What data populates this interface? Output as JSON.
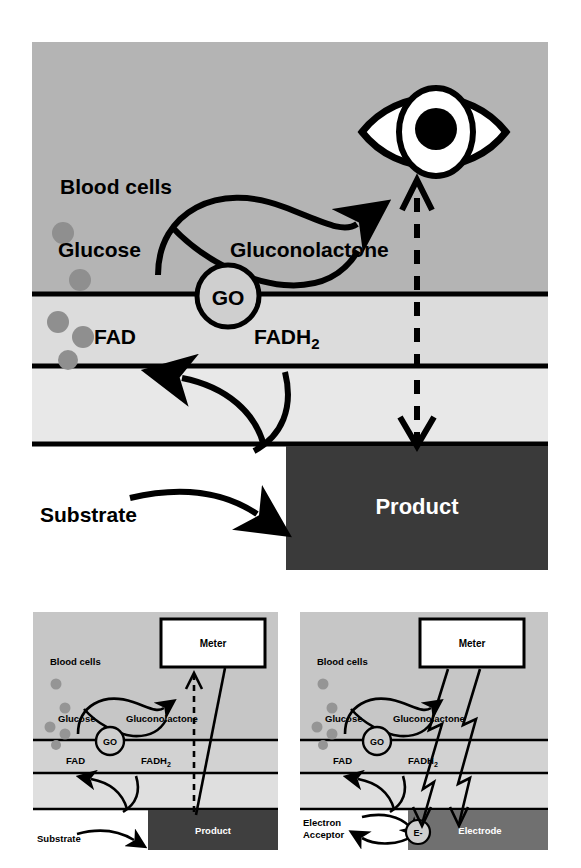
{
  "figure": {
    "panel_count": 3
  },
  "colors": {
    "page_background": "#ffffff",
    "sample_layer": "#b4b4b4",
    "enzyme_layer": "#dcdcdc",
    "mediator_layer": "#e6e6e6",
    "substrate_layer": "#ffffff",
    "product_bar": "#3a3a3a",
    "electrode_bar": "#6e6e6e",
    "blood_cell": "#8f8f8f",
    "line": "#000000",
    "meter_fill": "#ffffff",
    "product_text": "#ffffff"
  },
  "main_panel": {
    "name": "optical-biosensor-overview",
    "labels": {
      "blood_cells": "Blood cells",
      "glucose": "Glucose",
      "gluconolactone": "Gluconolactone",
      "enzyme": "GO",
      "fad": "FAD",
      "fadh2": "FADH",
      "fadh2_sub": "2",
      "substrate": "Substrate",
      "product": "Product"
    },
    "detector": "eye-icon",
    "signal_type": "optical (dashed arrow to eye)",
    "blood_cells": [
      {
        "cx": 63,
        "cy": 233,
        "r": 10
      },
      {
        "cx": 80,
        "cy": 280,
        "r": 10
      },
      {
        "cx": 58,
        "cy": 322,
        "r": 10
      },
      {
        "cx": 83,
        "cy": 337,
        "r": 10
      },
      {
        "cx": 68,
        "cy": 360,
        "r": 9
      }
    ]
  },
  "bottom_left_panel": {
    "name": "optical-meter-biosensor",
    "labels": {
      "blood_cells": "Blood cells",
      "glucose": "Glucose",
      "gluconolactone": "Gluconolactone",
      "enzyme": "GO",
      "fad": "FAD",
      "fadh2": "FADH",
      "fadh2_sub": "2",
      "substrate": "Substrate",
      "product": "Product",
      "meter": "Meter"
    },
    "signal_type": "optical (dashed arrow to meter)",
    "blood_cells": [
      {
        "cx": 56,
        "cy": 638,
        "r": 5
      },
      {
        "cx": 68,
        "cy": 663,
        "r": 5
      },
      {
        "cx": 50,
        "cy": 688,
        "r": 5
      },
      {
        "cx": 68,
        "cy": 696,
        "r": 5
      },
      {
        "cx": 58,
        "cy": 709,
        "r": 5
      }
    ]
  },
  "bottom_right_panel": {
    "name": "amperometric-biosensor",
    "labels": {
      "blood_cells": "Blood cells",
      "glucose": "Glucose",
      "gluconolactone": "Gluconolactone",
      "enzyme": "GO",
      "fad": "FAD",
      "fadh2": "FADH",
      "fadh2_sub": "2",
      "electron_acceptor_line1": "Electron",
      "electron_acceptor_line2": "Acceptor",
      "electron": "E-",
      "electrode": "Electrode",
      "meter": "Meter"
    },
    "signal_type": "electrical (lightning bolts to meter)",
    "blood_cells": [
      {
        "cx": 318,
        "cy": 638,
        "r": 5
      },
      {
        "cx": 330,
        "cy": 663,
        "r": 5
      },
      {
        "cx": 312,
        "cy": 688,
        "r": 5
      },
      {
        "cx": 330,
        "cy": 696,
        "r": 5
      },
      {
        "cx": 320,
        "cy": 709,
        "r": 5
      }
    ]
  }
}
